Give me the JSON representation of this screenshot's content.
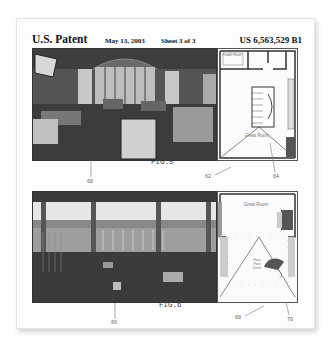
{
  "header": {
    "title": "U.S. Patent",
    "date": "May 13, 2003",
    "sheet": "Sheet 3 of 3",
    "patent_number": "US 6,563,529 B1"
  },
  "figures": [
    {
      "label": "FIG.5",
      "photo_description": "interior living room panorama",
      "plan_rooms": [
        "Powder Room",
        "Great Room"
      ],
      "reference_numerals": {
        "photo": "60",
        "plan_pointer": "62",
        "room_pointer": "64"
      }
    },
    {
      "label": "FIG.6",
      "photo_description": "exterior pool deck panorama",
      "plan_rooms": [
        "Great Room",
        "Rear Pool Deck"
      ],
      "reference_numerals": {
        "photo": "66",
        "plan_pointer": "69",
        "room_pointer": "70"
      }
    }
  ]
}
